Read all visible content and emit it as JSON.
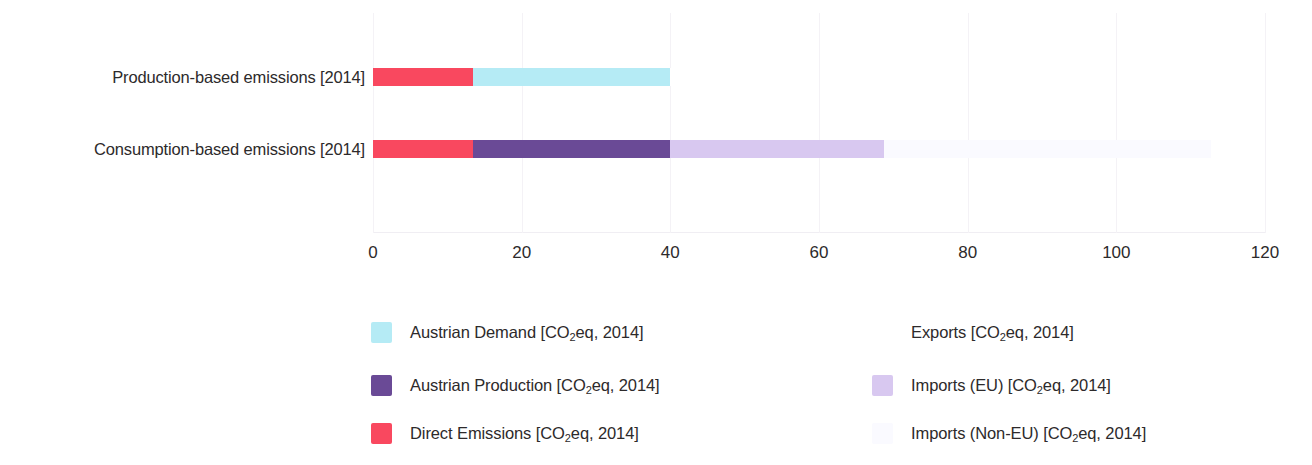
{
  "chart_data": {
    "type": "bar",
    "orientation": "horizontal",
    "stacked": true,
    "title": "",
    "xlabel": "",
    "ylabel": "",
    "xlim": [
      0,
      120
    ],
    "ylim": null,
    "grid": true,
    "grid_axis": "x",
    "legend_position": "bottom",
    "xticks": [
      0,
      20,
      40,
      60,
      80,
      100,
      120
    ],
    "xtick_labels": [
      "0",
      "20",
      "40",
      "60",
      "80",
      "100",
      "120"
    ],
    "categories": [
      "Production-based emissions [2014]",
      "Consumption-based emissions [2014]"
    ],
    "series": [
      {
        "name": "Direct Emissions [CO2eq, 2014]",
        "color": "#f9485f",
        "values": [
          13.5,
          13.5
        ]
      },
      {
        "name": "Austrian Demand [CO2eq, 2014]",
        "color": "#b5ebf5",
        "values": [
          26.5,
          0
        ]
      },
      {
        "name": "Austrian Production [CO2eq, 2014]",
        "color": "#6a4a96",
        "values": [
          0,
          26.5
        ]
      },
      {
        "name": "Exports [CO2eq, 2014]",
        "color": "#ffffff",
        "values": [
          0.2,
          0
        ]
      },
      {
        "name": "Imports (EU) [CO2eq, 2014]",
        "color": "#d8c8f0",
        "values": [
          0,
          28.8
        ]
      },
      {
        "name": "Imports (Non-EU) [CO2eq, 2014]",
        "color": "#fafaff",
        "values": [
          0,
          44.0
        ]
      }
    ],
    "bar_totals": [
      40.2,
      112.8
    ],
    "annotations": []
  },
  "axis": {
    "categories": [
      {
        "label": "Production-based emissions [2014]"
      },
      {
        "label": "Consumption-based emissions [2014]"
      }
    ],
    "xticks": [
      {
        "label": "0",
        "value": 0
      },
      {
        "label": "20",
        "value": 20
      },
      {
        "label": "40",
        "value": 40
      },
      {
        "label": "60",
        "value": 60
      },
      {
        "label": "80",
        "value": 80
      },
      {
        "label": "100",
        "value": 100
      },
      {
        "label": "120",
        "value": 120
      }
    ]
  },
  "bars": [
    {
      "category": "Production-based emissions [2014]",
      "segments": [
        {
          "name": "Direct Emissions [CO2eq, 2014]",
          "start": 0,
          "end": 13.5,
          "color": "#f9485f"
        },
        {
          "name": "Austrian Demand [CO2eq, 2014]",
          "start": 13.5,
          "end": 40.0,
          "color": "#b5ebf5"
        },
        {
          "name": "Exports [CO2eq, 2014]",
          "start": 40.0,
          "end": 40.2,
          "color": "#ffffff"
        }
      ]
    },
    {
      "category": "Consumption-based emissions [2014]",
      "segments": [
        {
          "name": "Direct Emissions [CO2eq, 2014]",
          "start": 0,
          "end": 13.5,
          "color": "#f9485f"
        },
        {
          "name": "Austrian Production [CO2eq, 2014]",
          "start": 13.5,
          "end": 40.0,
          "color": "#6a4a96"
        },
        {
          "name": "Imports (EU) [CO2eq, 2014]",
          "start": 40.0,
          "end": 68.8,
          "color": "#d8c8f0"
        },
        {
          "name": "Imports (Non-EU) [CO2eq, 2014]",
          "start": 68.8,
          "end": 112.8,
          "color": "#fafaff"
        }
      ]
    }
  ],
  "legend": {
    "columns": [
      {
        "items": [
          {
            "label_prefix": "Austrian Demand [CO",
            "label_sub": "2",
            "label_suffix": "eq, 2014]",
            "color": "#b5ebf5",
            "name": "austrian-demand"
          },
          {
            "label_prefix": "Austrian Production [CO",
            "label_sub": "2",
            "label_suffix": "eq, 2014]",
            "color": "#6a4a96",
            "name": "austrian-production"
          },
          {
            "label_prefix": "Direct Emissions [CO",
            "label_sub": "2",
            "label_suffix": "eq, 2014]",
            "color": "#f9485f",
            "name": "direct-emissions"
          }
        ]
      },
      {
        "items": [
          {
            "label_prefix": "Exports [CO",
            "label_sub": "2",
            "label_suffix": "eq, 2014]",
            "color": "#ffffff",
            "name": "exports"
          },
          {
            "label_prefix": "Imports (EU) [CO",
            "label_sub": "2",
            "label_suffix": "eq, 2014]",
            "color": "#d8c8f0",
            "name": "imports-eu"
          },
          {
            "label_prefix": "Imports (Non-EU) [CO",
            "label_sub": "2",
            "label_suffix": "eq, 2014]",
            "color": "#fafaff",
            "name": "imports-non-eu"
          }
        ]
      }
    ]
  },
  "colors": {
    "direct_emissions": "#f9485f",
    "austrian_demand": "#b5ebf5",
    "austrian_production": "#6a4a96",
    "exports": "#ffffff",
    "imports_eu": "#d8c8f0",
    "imports_non_eu": "#fafaff",
    "gridline": "#f4f2f6",
    "text": "#2d2a2b"
  }
}
